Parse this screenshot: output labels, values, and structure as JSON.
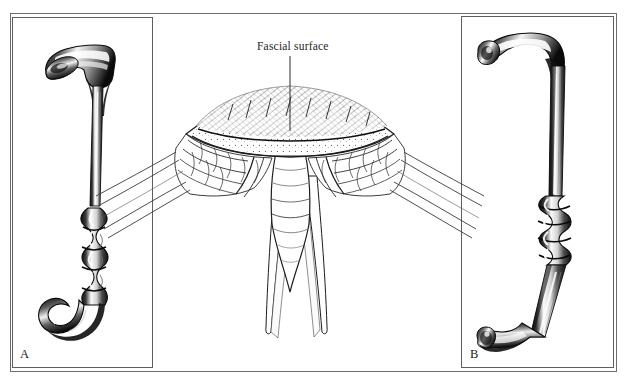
{
  "figure": {
    "panels": [
      {
        "id": "A",
        "letter": "A",
        "caption": "A",
        "instrument": "right-angle-retractor-ribbed-handle-hook-end"
      },
      {
        "id": "B",
        "letter": "B",
        "caption": "B",
        "instrument": "z-shaped-retractor-coiled-grip-foot-blade"
      }
    ],
    "annotations": [
      {
        "text": "Fascial surface",
        "leader_from": {
          "x": 290,
          "y": 56
        },
        "leader_to": {
          "x": 290,
          "y": 131
        }
      }
    ],
    "center_illustration": {
      "name": "surgical-incision-cross-section",
      "description": "Midline wound cross-section showing hatched subcutaneous fat, layered muscle planes and exposed fascial surface with retracted edges"
    },
    "colors": {
      "background": "#ffffff",
      "ink": "#141414",
      "frame": "#6d6d6d",
      "panel_border": "#5f5f5f",
      "hatch": "#2b2b2b"
    }
  }
}
